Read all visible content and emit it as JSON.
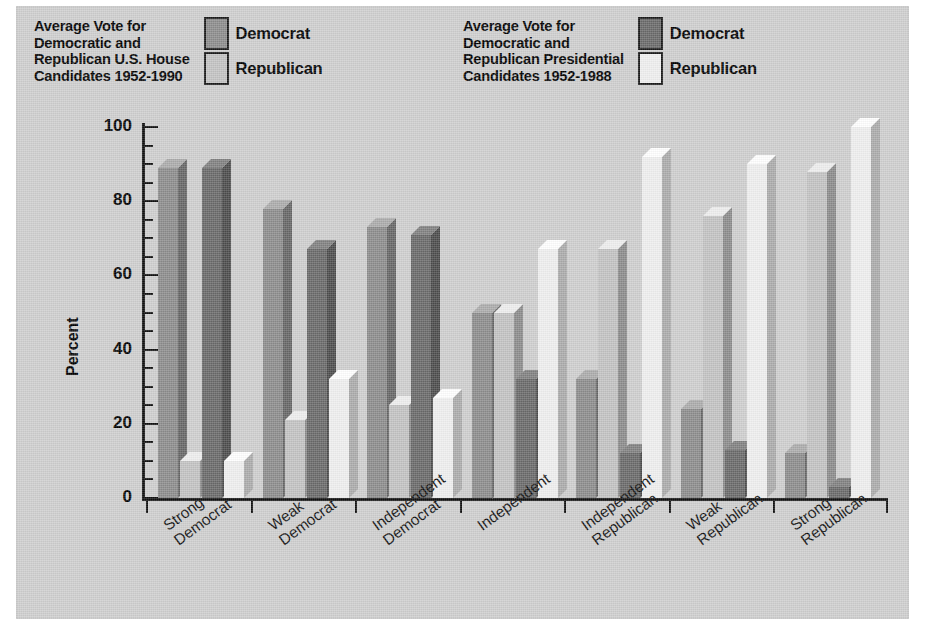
{
  "figure": {
    "background_color": "#cfcfcf",
    "legends": [
      {
        "title": "Average Vote for\nDemocratic and\nRepublican U.S. House\nCandidates 1952-1990",
        "keys": [
          {
            "label": "Democrat",
            "color": "#8d8d8d"
          },
          {
            "label": "Republican",
            "color": "#c3c3c3"
          }
        ]
      },
      {
        "title": "Average Vote for\nDemocratic and\nRepublican Presidential\nCandidates 1952-1988",
        "keys": [
          {
            "label": "Democrat",
            "color": "#6a6a6a"
          },
          {
            "label": "Republican",
            "color": "#efefef"
          }
        ]
      }
    ]
  },
  "chart_data": {
    "type": "bar",
    "xlabel": "",
    "ylabel": "Percent",
    "ylim": [
      0,
      100
    ],
    "ytick_labels": [
      "0",
      "20",
      "40",
      "60",
      "80",
      "100"
    ],
    "ytick_values": [
      0,
      20,
      40,
      60,
      80,
      100
    ],
    "minor_tick_step": 5,
    "grid": false,
    "legend_position": "top",
    "categories": [
      "Strong\nDemocrat",
      "Weak\nDemocrat",
      "Independent\nDemocrat",
      "Independent",
      "Independent\nRepublican",
      "Weak\nRepublican",
      "Strong\nRepublican"
    ],
    "series": [
      {
        "name": "House Democrat",
        "color": "#8d8d8d",
        "values": [
          89,
          78,
          73,
          50,
          32,
          24,
          12
        ]
      },
      {
        "name": "House Republican",
        "color": "#c3c3c3",
        "values": [
          10,
          21,
          25,
          50,
          67,
          76,
          88
        ]
      },
      {
        "name": "Presidential Democrat",
        "color": "#6a6a6a",
        "values": [
          89,
          67,
          71,
          32,
          12,
          13,
          3
        ]
      },
      {
        "name": "Presidential Republican",
        "color": "#efefef",
        "values": [
          10,
          32,
          27,
          67,
          92,
          90,
          100
        ]
      }
    ]
  },
  "y_axis": {
    "label": "Percent"
  }
}
